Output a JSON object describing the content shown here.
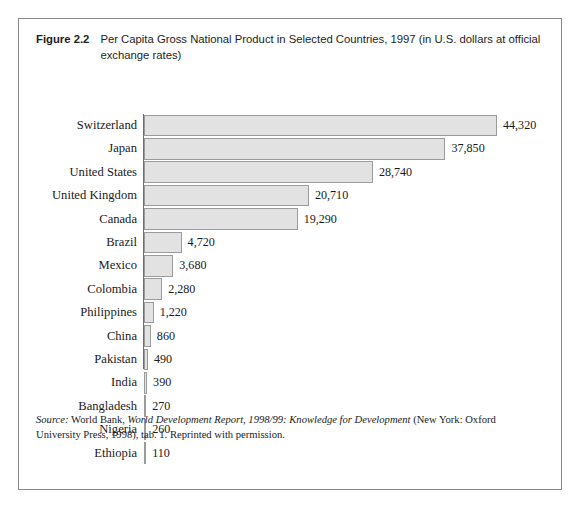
{
  "figure": {
    "number_label": "Figure 2.2",
    "caption": "Per Capita Gross National Product in Selected Countries, 1997 (in U.S. dollars at official exchange rates)"
  },
  "source_note": {
    "prefix": "Source:",
    "publisher": " World Bank, ",
    "title": "World Development Report, 1998/99: Knowledge for Development",
    "tail": " (New York: Oxford University Press, 1998), tab. 1. Reprinted with permission."
  },
  "colors": {
    "bar_fill": "#e2e2e2",
    "bar_border": "#9b9b9b",
    "frame_border": "#8a8a8a",
    "axis": "#6e6e6e",
    "text": "#1a1a1a"
  },
  "chart_data": {
    "type": "bar",
    "orientation": "horizontal",
    "title": "Per Capita Gross National Product in Selected Countries, 1997 (in U.S. dollars at official exchange rates)",
    "xlabel": "",
    "ylabel": "",
    "unit": "U.S. dollars at official exchange rates",
    "year": 1997,
    "grid": false,
    "legend": "none",
    "xlim": [
      0,
      44320
    ],
    "categories": [
      "Switzerland",
      "Japan",
      "United States",
      "United Kingdom",
      "Canada",
      "Brazil",
      "Mexico",
      "Colombia",
      "Philippines",
      "China",
      "Pakistan",
      "India",
      "Bangladesh",
      "Nigeria",
      "Ethiopia"
    ],
    "values": [
      44320,
      37850,
      28740,
      20710,
      19290,
      4720,
      3680,
      2280,
      1220,
      860,
      490,
      390,
      270,
      260,
      110
    ],
    "value_labels": [
      "44,320",
      "37,850",
      "28,740",
      "20,710",
      "19,290",
      "4,720",
      "3,680",
      "2,280",
      "1,220",
      "860",
      "490",
      "390",
      "270",
      "260",
      "110"
    ]
  }
}
